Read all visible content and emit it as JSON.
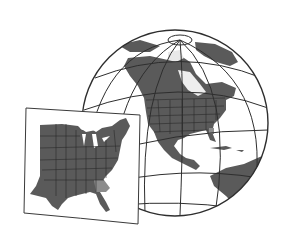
{
  "illustration": {
    "title": "Globe with eastern United States map inset",
    "colors": {
      "background": "#ffffff",
      "ocean": "#ffffff",
      "land": "#5a5a5a",
      "land_light": "#7a7a7a",
      "highlight_state": "#8c8c8c",
      "outline": "#2e2e2e",
      "ice": "#e9e9e9"
    },
    "globe": {
      "cx": 175,
      "cy": 123,
      "r": 94
    },
    "inset": {
      "highlighted_state": "Georgia"
    }
  }
}
